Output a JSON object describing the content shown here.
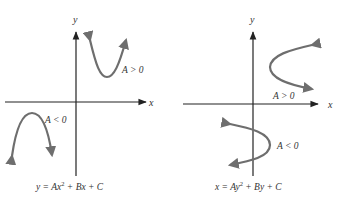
{
  "colors": {
    "axis": "#222222",
    "curve": "#6e6e6e",
    "text": "#333333",
    "background": "#ffffff"
  },
  "left_panel": {
    "x_axis_label": "x",
    "y_axis_label": "y",
    "upper_curve_label": "A > 0",
    "lower_curve_label": "A < 0",
    "caption_lhs": "y = Ax",
    "caption_exp": "2",
    "caption_rhs": " + Bx + C",
    "caption": "y = Ax² + Bx + C"
  },
  "right_panel": {
    "x_axis_label": "x",
    "y_axis_label": "y",
    "upper_curve_label": "A > 0",
    "lower_curve_label": "A < 0",
    "caption_lhs": "x = Ay",
    "caption_exp": "2",
    "caption_rhs": " + By + C",
    "caption": "x = Ay² + By + C"
  }
}
